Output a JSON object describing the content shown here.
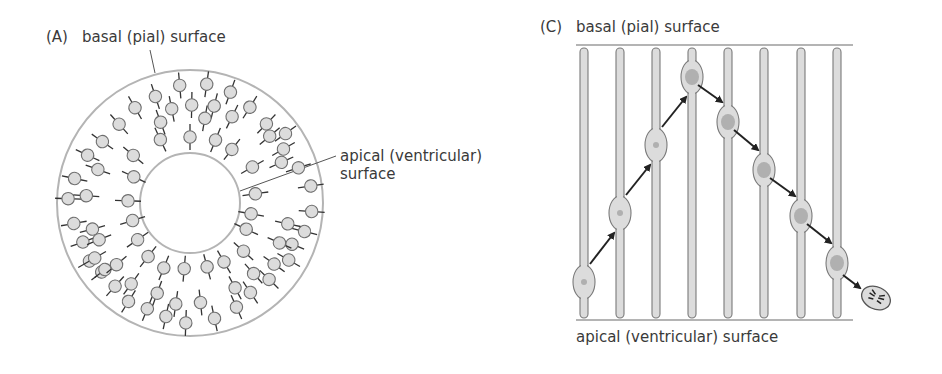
{
  "panel_a": {
    "letter": "(A)",
    "basal_label": "basal (pial) surface",
    "apical_label_line1": "apical (ventricular)",
    "apical_label_line2": "surface",
    "lumen_line1": "lumen",
    "lumen_line2": "(future",
    "lumen_line3": "ventricle)"
  },
  "panel_c": {
    "letter": "(C)",
    "basal_label": "basal (pial) surface",
    "apical_label": "apical (ventricular) surface"
  },
  "colors": {
    "cell_fill": "#dcdcdc",
    "cell_stroke": "#7a7a7a",
    "nucleus": "#b0b0b0",
    "surface_line": "#b4b4b4",
    "arrow": "#222222",
    "text": "#3a3a3a"
  }
}
